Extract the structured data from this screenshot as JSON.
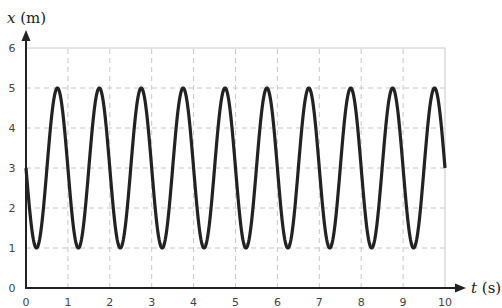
{
  "chart_data": {
    "type": "line",
    "title": "",
    "xlabel": "t (s)",
    "ylabel": "x (m)",
    "xlabel_var": "t",
    "xlabel_unit": "(s)",
    "ylabel_var": "x",
    "ylabel_unit": "(m)",
    "xlim": [
      0,
      10
    ],
    "ylim": [
      0,
      6
    ],
    "xticks": [
      0,
      1,
      2,
      3,
      4,
      5,
      6,
      7,
      8,
      9,
      10
    ],
    "yticks": [
      0,
      1,
      2,
      3,
      4,
      5,
      6
    ],
    "grid": true,
    "legend": null,
    "function": "x(t) = 3 - 2*sin(2*pi*t)",
    "equilibrium": 3,
    "amplitude": 2,
    "period": 1,
    "series": [
      {
        "name": "x(t)",
        "color": "#222222",
        "x": [
          0,
          0.25,
          0.5,
          0.75,
          1,
          1.25,
          1.5,
          1.75,
          2,
          2.25,
          2.5,
          2.75,
          3,
          3.25,
          3.5,
          3.75,
          4,
          4.25,
          4.5,
          4.75,
          5,
          5.25,
          5.5,
          5.75,
          6,
          6.25,
          6.5,
          6.75,
          7,
          7.25,
          7.5,
          7.75,
          8,
          8.25,
          8.5,
          8.75,
          9,
          9.25,
          9.5,
          9.75,
          10
        ],
        "values": [
          3,
          1,
          3,
          5,
          3,
          1,
          3,
          5,
          3,
          1,
          3,
          5,
          3,
          1,
          3,
          5,
          3,
          1,
          3,
          5,
          3,
          1,
          3,
          5,
          3,
          1,
          3,
          5,
          3,
          1,
          3,
          5,
          3,
          1,
          3,
          5,
          3,
          1,
          3,
          5,
          3
        ]
      }
    ]
  },
  "colors": {
    "curve": "#222222",
    "axis": "#222222",
    "grid": "#c8c8c8"
  }
}
